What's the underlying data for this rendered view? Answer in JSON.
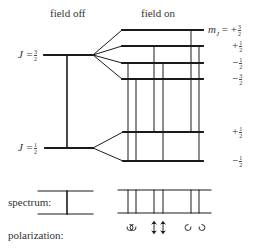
{
  "headers": {
    "field_off": "field off",
    "field_on": "field on"
  },
  "levels": {
    "upper": {
      "label_prefix": "J =",
      "num": "3",
      "den": "2"
    },
    "lower": {
      "label_prefix": "J =",
      "num": "1",
      "den": "2"
    }
  },
  "sublevels": {
    "mj_prefix": "m",
    "mj_sub": "J",
    "upper": [
      {
        "sign": "= +",
        "num": "3",
        "den": "2"
      },
      {
        "sign": "+",
        "num": "1",
        "den": "2"
      },
      {
        "sign": "−",
        "num": "1",
        "den": "2"
      },
      {
        "sign": "−",
        "num": "3",
        "den": "2"
      }
    ],
    "lower": [
      {
        "sign": "+",
        "num": "1",
        "den": "2"
      },
      {
        "sign": "−",
        "num": "1",
        "den": "2"
      }
    ]
  },
  "rows": {
    "spectrum": "spectrum:",
    "polarization": "polarization:"
  },
  "polarization_symbols": {
    "sigma_left": "↺↻",
    "pi": "↕↕",
    "sigma_right": "↺↻"
  },
  "colors": {
    "line": "#1a1a1a",
    "text": "#333333"
  }
}
